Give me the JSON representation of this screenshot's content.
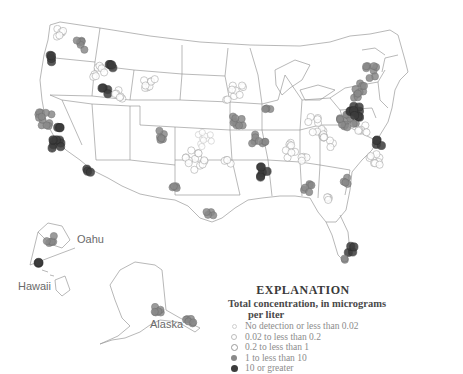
{
  "map": {
    "subject": "Total concentration sampling sites, conterminous United States, Alaska, Hawaii",
    "insets": [
      {
        "label": "Oahu",
        "x": 77,
        "y": 233
      },
      {
        "label": "Hawaii",
        "x": 20,
        "y": 278,
        "display": "Hawaii"
      },
      {
        "label": "Alaska",
        "x": 150,
        "y": 318
      }
    ]
  },
  "legend": {
    "title": "EXPLANATION",
    "subtitle_line1": "Total concentration, in micrograms",
    "subtitle_line2": "per liter",
    "classes": [
      {
        "label": "No detection or less than 0.02",
        "fill": "#ffffff",
        "stroke": "#cfcfcf",
        "size": 3
      },
      {
        "label": "0.02 to less than 0.2",
        "fill": "#ffffff",
        "stroke": "#bdbdbd",
        "size": 5
      },
      {
        "label": "0.2 to less than 1",
        "fill": "#ffffff",
        "stroke": "#9a9a9a",
        "size": 6
      },
      {
        "label": "1 to less than 10",
        "fill": "#8a8a8a",
        "stroke": "#6e6e6e",
        "size": 6
      },
      {
        "label": "10 or greater",
        "fill": "#3c3c3c",
        "stroke": "#2a2a2a",
        "size": 7
      }
    ]
  },
  "colors": {
    "boundary": "#8a8a8a",
    "low": "#ffffff",
    "mid": "#8a8a8a",
    "high": "#3c3c3c"
  }
}
